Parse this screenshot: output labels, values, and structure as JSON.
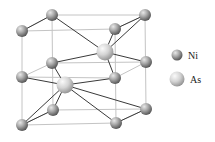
{
  "colors": {
    "background": "#ffffff",
    "frame": "#c4c4c4",
    "bond": "#3a3a3a",
    "ni_light": "#d0d0d0",
    "ni_dark": "#5a5a5a",
    "as_light": "#f2f2f2",
    "as_dark": "#9a9a9a"
  },
  "legend": [
    {
      "symbol": "Ni",
      "label": "Ni",
      "x": 177,
      "y": 55,
      "r": 5.5,
      "label_x": 188,
      "label_y": 51
    },
    {
      "symbol": "As",
      "label": "As",
      "x": 177,
      "y": 79,
      "r": 7.5,
      "label_x": 190,
      "label_y": 75
    }
  ],
  "atoms": [
    {
      "id": "ni-ftl",
      "el": "Ni",
      "x": 22,
      "y": 31
    },
    {
      "id": "ni-btl",
      "el": "Ni",
      "x": 52,
      "y": 15
    },
    {
      "id": "ni-btr",
      "el": "Ni",
      "x": 145,
      "y": 15
    },
    {
      "id": "ni-ftr",
      "el": "Ni",
      "x": 115,
      "y": 29
    },
    {
      "id": "ni-fml",
      "el": "Ni",
      "x": 22,
      "y": 77
    },
    {
      "id": "ni-bml",
      "el": "Ni",
      "x": 52,
      "y": 63
    },
    {
      "id": "ni-fmr",
      "el": "Ni",
      "x": 115,
      "y": 78
    },
    {
      "id": "ni-bmr",
      "el": "Ni",
      "x": 146,
      "y": 62
    },
    {
      "id": "ni-fbl",
      "el": "Ni",
      "x": 22,
      "y": 125
    },
    {
      "id": "ni-bbl",
      "el": "Ni",
      "x": 53,
      "y": 110
    },
    {
      "id": "ni-fbr",
      "el": "Ni",
      "x": 116,
      "y": 123
    },
    {
      "id": "ni-bbr",
      "el": "Ni",
      "x": 146,
      "y": 109
    },
    {
      "id": "as-upper",
      "el": "As",
      "x": 105,
      "y": 52
    },
    {
      "id": "as-lower",
      "el": "As",
      "x": 65,
      "y": 85
    }
  ],
  "frame_edges": [
    [
      22,
      31,
      115,
      29
    ],
    [
      115,
      29,
      116,
      123
    ],
    [
      116,
      123,
      22,
      125
    ],
    [
      22,
      125,
      22,
      31
    ],
    [
      52,
      15,
      145,
      15
    ],
    [
      145,
      15,
      146,
      109
    ],
    [
      146,
      109,
      53,
      110
    ],
    [
      53,
      110,
      52,
      15
    ],
    [
      22,
      31,
      52,
      15
    ],
    [
      115,
      29,
      145,
      15
    ],
    [
      116,
      123,
      146,
      109
    ],
    [
      22,
      125,
      53,
      110
    ],
    [
      22,
      77,
      115,
      78
    ],
    [
      52,
      63,
      146,
      62
    ],
    [
      22,
      77,
      52,
      63
    ],
    [
      115,
      78,
      146,
      62
    ]
  ],
  "bonds": [
    [
      22,
      31,
      52,
      15
    ],
    [
      115,
      29,
      145,
      15
    ],
    [
      105,
      52,
      52,
      15
    ],
    [
      105,
      52,
      145,
      15
    ],
    [
      105,
      52,
      115,
      29
    ],
    [
      105,
      52,
      52,
      63
    ],
    [
      105,
      52,
      146,
      62
    ],
    [
      105,
      52,
      115,
      78
    ],
    [
      65,
      85,
      22,
      77
    ],
    [
      65,
      85,
      115,
      78
    ],
    [
      65,
      85,
      52,
      63
    ],
    [
      65,
      85,
      146,
      109
    ],
    [
      65,
      85,
      116,
      123
    ],
    [
      65,
      85,
      53,
      110
    ],
    [
      65,
      85,
      22,
      125
    ],
    [
      22,
      125,
      53,
      110
    ],
    [
      116,
      123,
      146,
      109
    ]
  ]
}
